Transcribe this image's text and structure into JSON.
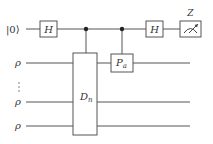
{
  "diagram": {
    "type": "quantum-circuit",
    "qubits": [
      {
        "label": "|0⟩",
        "role": "ancilla"
      },
      {
        "label": "ρ",
        "role": "register"
      },
      {
        "label": "⋮",
        "role": "ellipsis"
      },
      {
        "label": "ρ",
        "role": "register"
      },
      {
        "label": "ρ",
        "role": "register"
      }
    ],
    "gates": {
      "h1": "H",
      "dn_main": "D",
      "dn_sub": "n",
      "pa_main": "P",
      "pa_sub": "a",
      "h2": "H",
      "measure_label": "Z"
    },
    "colors": {
      "line": "#555555",
      "text": "#333333",
      "background": "#ffffff"
    }
  }
}
